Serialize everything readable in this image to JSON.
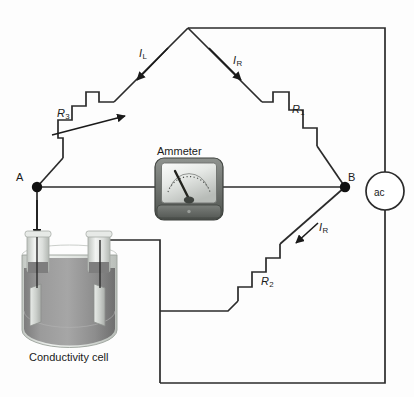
{
  "diagram": {
    "type": "circuit-schematic",
    "background_color": "#fdfdfd",
    "wire_color": "#2b2b2b"
  },
  "nodes": {
    "a_label": "A",
    "b_label": "B"
  },
  "currents": {
    "left_label": "I",
    "left_sub": "L",
    "right_top_label": "I",
    "right_top_sub": "R",
    "right_bottom_label": "I",
    "right_bottom_sub": "R"
  },
  "resistors": [
    {
      "label": "R",
      "sub": "1",
      "name": "resistor-r1",
      "variable": false
    },
    {
      "label": "R",
      "sub": "2",
      "name": "resistor-r2",
      "variable": false
    },
    {
      "label": "R",
      "sub": "3",
      "name": "resistor-r3",
      "variable": true
    }
  ],
  "instruments": {
    "ammeter_label": "Ammeter",
    "ac_source_label": "ac"
  },
  "cell": {
    "caption": "Conductivity cell",
    "liquid_color": "#8c8c8c",
    "glass_color": "#d8dcd8",
    "electrode_color": "#cfd2cf"
  }
}
